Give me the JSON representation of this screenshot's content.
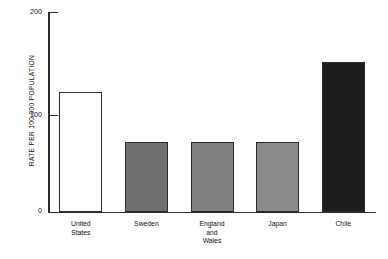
{
  "chart_data": {
    "type": "bar",
    "title": "",
    "xlabel": "",
    "ylabel": "RATE PER 100,000 POPULATION",
    "ylim": [
      0,
      200
    ],
    "yticks": [
      "0",
      "100",
      "200"
    ],
    "grid": false,
    "legend": "none",
    "categories": [
      "United States",
      "Sweden",
      "England and Wales",
      "Japan",
      "Chile"
    ],
    "category_lines": [
      [
        "United",
        "States"
      ],
      [
        "Sweden"
      ],
      [
        "England",
        "and",
        "Wales"
      ],
      [
        "Japan"
      ],
      [
        "Chile"
      ]
    ],
    "values": [
      120,
      70,
      70,
      70,
      150
    ],
    "bar_colors": [
      "#ffffff",
      "#6e6e6e",
      "#808080",
      "#8a8a8a",
      "#1c1c1c"
    ],
    "bar_edge_color": "#2b2b2b",
    "axis_color": "#2b2b2b",
    "background_color": "#ffffff"
  },
  "axis": {
    "y_title": "RATE PER 100,000 POPULATION",
    "tick_200": "200",
    "tick_100": "100",
    "tick_0": "0"
  }
}
